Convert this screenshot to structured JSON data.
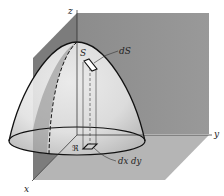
{
  "figure": {
    "axes": {
      "x_label": "x",
      "y_label": "y",
      "z_label": "z"
    },
    "labels": {
      "surface": "S",
      "surface_element": "dS",
      "region": "ℜ",
      "area_element": "dx dy"
    },
    "colors": {
      "back_wall": "#8e8e8e",
      "side_wall": "#7a7a7a",
      "floor": "#b4b4b4",
      "surface_light": "#f2f2f2",
      "surface_shade": "#c8c8c8",
      "outline": "#111111"
    }
  }
}
